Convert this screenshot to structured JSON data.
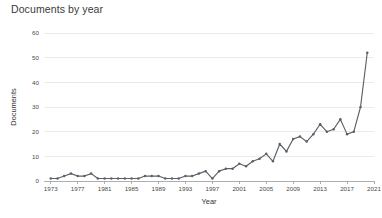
{
  "chart_data": {
    "type": "line",
    "title": "Documents by year",
    "xlabel": "Year",
    "ylabel": "Documents",
    "xlim": [
      1972,
      2021
    ],
    "ylim": [
      0,
      60
    ],
    "xticks": [
      1973,
      1977,
      1981,
      1985,
      1989,
      1993,
      1997,
      2001,
      2005,
      2009,
      2013,
      2017,
      2021
    ],
    "yticks": [
      0,
      10,
      20,
      30,
      40,
      50,
      60
    ],
    "grid": true,
    "legend": false,
    "series": [
      {
        "name": "Documents",
        "color": "#5b6168",
        "marker": "circle",
        "x": [
          1973,
          1974,
          1975,
          1976,
          1977,
          1978,
          1979,
          1980,
          1981,
          1982,
          1983,
          1984,
          1985,
          1986,
          1987,
          1988,
          1989,
          1990,
          1991,
          1992,
          1993,
          1994,
          1995,
          1996,
          1997,
          1998,
          1999,
          2000,
          2001,
          2002,
          2003,
          2004,
          2005,
          2006,
          2007,
          2008,
          2009,
          2010,
          2011,
          2012,
          2013,
          2014,
          2015,
          2016,
          2017,
          2018,
          2019,
          2020
        ],
        "values": [
          1,
          1,
          2,
          3,
          2,
          2,
          3,
          1,
          1,
          1,
          1,
          1,
          1,
          1,
          2,
          2,
          2,
          1,
          1,
          1,
          2,
          2,
          3,
          4,
          1,
          4,
          5,
          5,
          7,
          6,
          8,
          9,
          11,
          8,
          15,
          12,
          17,
          18,
          16,
          19,
          23,
          20,
          21,
          25,
          19,
          20,
          30,
          52
        ]
      }
    ]
  },
  "axis": {
    "ylabel": "Documents",
    "xlabel": "Year"
  }
}
